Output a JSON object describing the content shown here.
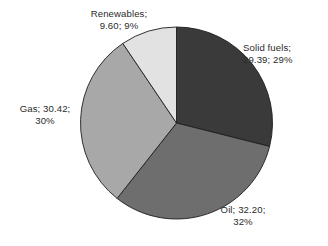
{
  "chart_data": {
    "type": "pie",
    "title": "",
    "categories": [
      "Solid fuels",
      "Oil",
      "Gas",
      "Renewables"
    ],
    "values": [
      29.39,
      32.2,
      30.42,
      9.6
    ],
    "percentages": [
      29,
      32,
      30,
      9
    ],
    "legend_position": "outside-labels",
    "grid": false,
    "start_angle_deg": 0,
    "direction": "clockwise",
    "slices": [
      {
        "name": "Solid fuels",
        "value": 29.39,
        "percent": 29,
        "color": "#3a3a3a",
        "label_line1": "Solid fuels;",
        "label_line2": "29.39; 29%"
      },
      {
        "name": "Oil",
        "value": 32.2,
        "percent": 32,
        "color": "#6e6e6e",
        "label_line1": "Oil; 32.20;",
        "label_line2": "32%"
      },
      {
        "name": "Gas",
        "value": 30.42,
        "percent": 30,
        "color": "#a8a8a8",
        "label_line1": "Gas; 30.42;",
        "label_line2": "30%"
      },
      {
        "name": "Renewables",
        "value": 9.6,
        "percent": 9,
        "color": "#e2e2e2",
        "label_line1": "Renewables;",
        "label_line2": "9.60; 9%"
      }
    ],
    "colors": {
      "background": "#ffffff",
      "text": "#2b2b2b",
      "outline": "#1d1d1d"
    }
  }
}
